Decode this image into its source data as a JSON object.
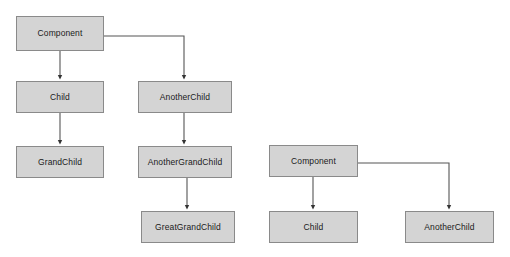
{
  "diagram": {
    "type": "tree-diagram",
    "canvas": {
      "width": 510,
      "height": 257,
      "background": "#ffffff"
    },
    "style": {
      "node_fill": "#d4d4d4",
      "node_border": "#8a8a8a",
      "edge_color": "#555555",
      "text_color": "#1a1a1a"
    },
    "graphs": [
      {
        "name": "deep-hierarchy",
        "nodes": [
          {
            "id": "component",
            "label": "Component",
            "x": 16,
            "y": 16,
            "w": 88,
            "h": 35
          },
          {
            "id": "child",
            "label": "Child",
            "x": 16,
            "y": 81,
            "w": 88,
            "h": 32
          },
          {
            "id": "anotherchild",
            "label": "AnotherChild",
            "x": 138,
            "y": 81,
            "w": 94,
            "h": 32
          },
          {
            "id": "grandchild",
            "label": "GrandChild",
            "x": 16,
            "y": 146,
            "w": 88,
            "h": 32
          },
          {
            "id": "anothergrandchild",
            "label": "AnotherGrandChild",
            "x": 138,
            "y": 146,
            "w": 94,
            "h": 32
          },
          {
            "id": "greatgrandchild",
            "label": "GreatGrandChild",
            "x": 141,
            "y": 211,
            "w": 94,
            "h": 32
          }
        ],
        "edges": [
          {
            "from": "component",
            "to": "child",
            "kind": "straight-down"
          },
          {
            "from": "component",
            "to": "anotherchild",
            "kind": "elbow-right"
          },
          {
            "from": "child",
            "to": "grandchild",
            "kind": "straight-down"
          },
          {
            "from": "anotherchild",
            "to": "anothergrandchild",
            "kind": "straight-down"
          },
          {
            "from": "anothergrandchild",
            "to": "greatgrandchild",
            "kind": "straight-down"
          }
        ]
      },
      {
        "name": "shallow-hierarchy",
        "nodes": [
          {
            "id": "component2",
            "label": "Component",
            "x": 269,
            "y": 145,
            "w": 89,
            "h": 32
          },
          {
            "id": "child2",
            "label": "Child",
            "x": 269,
            "y": 211,
            "w": 89,
            "h": 32
          },
          {
            "id": "anotherchild2",
            "label": "AnotherChild",
            "x": 405,
            "y": 211,
            "w": 89,
            "h": 32
          }
        ],
        "edges": [
          {
            "from": "component2",
            "to": "child2",
            "kind": "straight-down"
          },
          {
            "from": "component2",
            "to": "anotherchild2",
            "kind": "elbow-right"
          }
        ]
      }
    ]
  }
}
